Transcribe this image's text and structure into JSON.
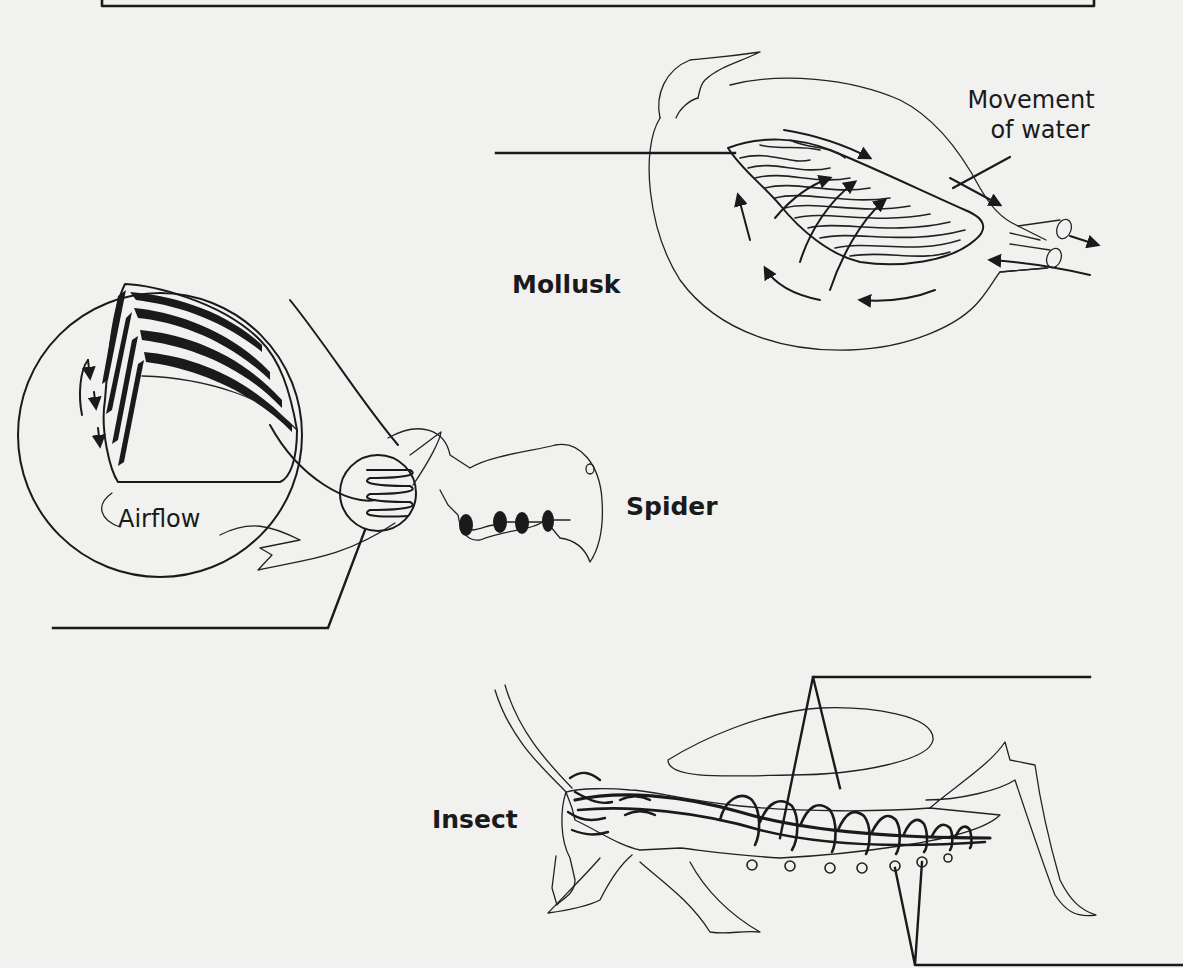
{
  "figure": {
    "organisms": [
      {
        "id": "mollusk",
        "label": "Mollusk"
      },
      {
        "id": "spider",
        "label": "Spider"
      },
      {
        "id": "insect",
        "label": "Insect"
      }
    ],
    "annotations": {
      "mollusk_water": [
        "Movement",
        "of water"
      ],
      "spider_airflow": "Airflow"
    },
    "blank_label_lines": 4,
    "colors": {
      "background": "#f1f1ef",
      "ink": "#1a1a1a"
    }
  }
}
